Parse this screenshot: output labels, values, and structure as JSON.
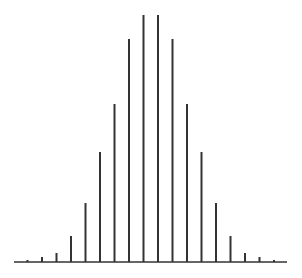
{
  "chart_data": {
    "type": "bar",
    "style": "stem",
    "title": "",
    "xlabel": "",
    "ylabel": "",
    "categories": [
      0,
      1,
      2,
      3,
      4,
      5,
      6,
      7,
      8,
      9,
      10,
      11,
      12,
      13,
      14,
      15,
      16,
      17
    ],
    "values": [
      2,
      5,
      9,
      26,
      59,
      110,
      158,
      223,
      247,
      247,
      223,
      158,
      110,
      59,
      26,
      9,
      5,
      2
    ],
    "ylim": [
      0,
      247
    ],
    "grid": false,
    "legend": null,
    "color": "#333333"
  },
  "layout": {
    "baseline_y": 262,
    "baseline_x_start": 14,
    "baseline_x_end": 287,
    "first_stem_x": 27.5,
    "stem_spacing": 14.5,
    "stem_width": 2
  }
}
